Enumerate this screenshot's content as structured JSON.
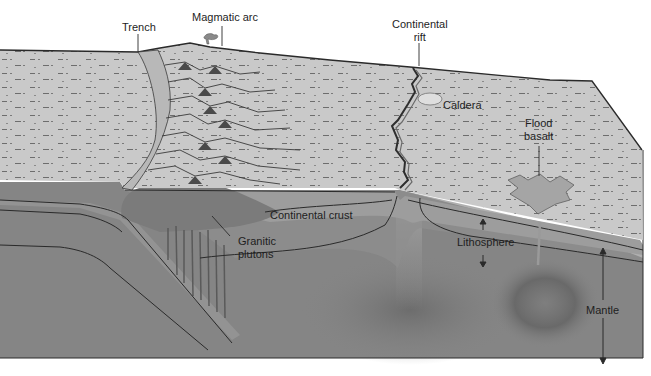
{
  "figure": {
    "colors": {
      "surface": "#c9c9c9",
      "crust": "#9c9c9c",
      "lithosphere": "#8f8f8f",
      "mantle": "#858585",
      "plume": "#6e6e6e",
      "lines": "#2a2a2a",
      "background": "#ffffff"
    },
    "labels": {
      "trench": "Trench",
      "magmatic_arc": "Magmatic arc",
      "continental_rift_line1": "Continental",
      "continental_rift_line2": "rift",
      "caldera": "Caldera",
      "flood_basalt_line1": "Flood",
      "flood_basalt_line2": "basalt",
      "continental_crust": "Continental crust",
      "granitic_plutons_line1": "Granitic",
      "granitic_plutons_line2": "plutons",
      "lithosphere": "Lithosphere",
      "mantle": "Mantle"
    }
  }
}
